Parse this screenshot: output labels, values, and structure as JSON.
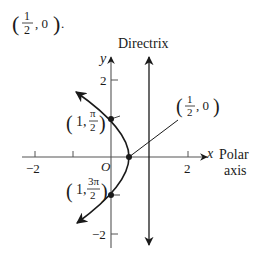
{
  "header": {
    "point_prefix": "(",
    "point_num": "1",
    "point_den": "2",
    "point_suffix": ", 0)",
    "trailing": "."
  },
  "axes": {
    "y_label": "y",
    "x_label": "x",
    "polar_label_line1": "Polar",
    "polar_label_line2": "axis",
    "origin_label": "O",
    "x_ticks": [
      {
        "label": "−2",
        "value": -2
      },
      {
        "label": "",
        "value": -1
      },
      {
        "label": "2",
        "value": 2
      }
    ],
    "y_ticks": [
      {
        "label": "2",
        "value": 2
      },
      {
        "label": "−2",
        "value": -2
      }
    ]
  },
  "directrix": {
    "label": "Directrix"
  },
  "points": {
    "vertex": {
      "label_num": "1",
      "label_den": "2",
      "label_rest": ", 0"
    },
    "upper": {
      "label_r": "1,",
      "label_num": "π",
      "label_den": "2"
    },
    "lower": {
      "label_r": "1,",
      "label_num": "3π",
      "label_den": "2"
    }
  },
  "colors": {
    "ink": "#1a1a1a",
    "axis": "#555555"
  }
}
